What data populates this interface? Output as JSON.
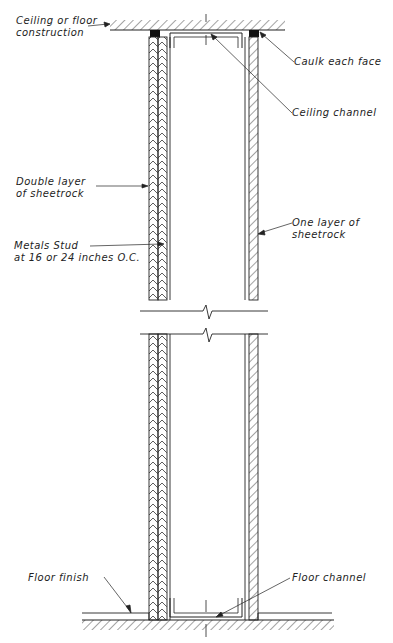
{
  "diagram": {
    "type": "wall-section-detail",
    "labels": {
      "ceiling_construction_1": "Ceiling or floor",
      "ceiling_construction_2": "construction",
      "caulk": "Caulk each face",
      "ceiling_channel": "Ceiling channel",
      "double_layer_1": "Double layer",
      "double_layer_2": "of sheetrock",
      "one_layer_1": "One layer of",
      "one_layer_2": "sheetrock",
      "metal_stud_1": "Metals Stud",
      "metal_stud_2": "at 16 or 24 inches O.C.",
      "floor_finish": "Floor finish",
      "floor_channel": "Floor channel"
    },
    "colors": {
      "line": "#222222",
      "background": "#ffffff"
    }
  }
}
